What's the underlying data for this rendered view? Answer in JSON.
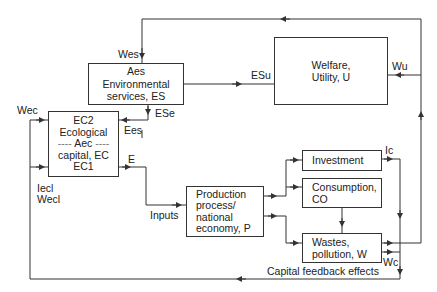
{
  "diagram": {
    "boxes": {
      "environmental_services": {
        "lines": [
          "Aes",
          "Environmental",
          "services, ES"
        ]
      },
      "welfare": {
        "lines": [
          "Welfare,",
          "Utility, U"
        ]
      },
      "ecological_capital": {
        "lines": [
          "EC2",
          "Ecological",
          "Aec",
          "capital, EC",
          "EC1"
        ],
        "dash": "----"
      },
      "production": {
        "lines": [
          "Production",
          "process/",
          "national",
          "economy, P"
        ]
      },
      "investment": {
        "lines": [
          "Investment"
        ]
      },
      "consumption": {
        "lines": [
          "Consumption,",
          "CO"
        ]
      },
      "wastes": {
        "lines": [
          "Wastes,",
          "pollution, W"
        ]
      }
    },
    "labels": {
      "wes": "Wes",
      "esu": "ESu",
      "wu": "Wu",
      "wec": "Wec",
      "ese": "ESe",
      "ees": "Ees",
      "e": "E",
      "iecl": "Iecl",
      "wecl": "Wecl",
      "inputs": "Inputs",
      "ic": "Ic",
      "wc": "Wc",
      "capital_feedback": "Capital feedback effects"
    },
    "colors": {
      "line": "#333333",
      "background": "#ffffff"
    }
  }
}
